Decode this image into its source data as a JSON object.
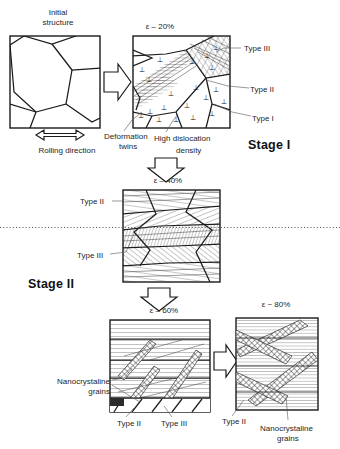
{
  "figure": {
    "kind": "schematic-diagram",
    "line_color": "#1b1b1b",
    "text_color": "#262626"
  },
  "panels": {
    "initial": {
      "title_line1": "Initial",
      "title_line2": "structure",
      "caption": "Rolling direction"
    },
    "strain20": {
      "epsilon": "ε – 20%"
    },
    "strain40": {
      "epsilon": "ε – 40%"
    },
    "strain60": {
      "epsilon": "ε – 60%"
    },
    "strain80": {
      "epsilon": "ε ~ 80%"
    }
  },
  "annotations": {
    "type1": "Type I",
    "type2": "Type II",
    "type3": "Type III",
    "deformation_twins_l1": "Deformation",
    "deformation_twins_l2": "twins",
    "high_disloc_l1": "High dislocation",
    "high_disloc_l2": "density",
    "nanocrystaline_l1": "Nanocrystaline",
    "nanocrystaline_l2": "grains",
    "type2_mid": "Type II",
    "type3_mid": "Type III",
    "type2_60": "Type II",
    "type3_60": "Type III",
    "type2_80": "Type II",
    "nano80_l1": "Nanocrystaline",
    "nano80_l2": "grains"
  },
  "stages": {
    "stage1": "Stage I",
    "stage2": "Stage II"
  },
  "icons": {
    "dislocation_symbol": "⊥",
    "arrow_right": "block-arrow-right",
    "arrow_down": "block-arrow-down",
    "rolling_arrow": "double-headed-arrow"
  }
}
